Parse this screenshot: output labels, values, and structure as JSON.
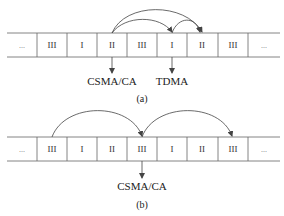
{
  "figure_a": {
    "caption": "(a)",
    "cells": [
      "...",
      "III",
      "I",
      "II",
      "III",
      "I",
      "II",
      "III",
      "..."
    ],
    "labels": {
      "csma": "CSMA/CA",
      "tdma": "TDMA"
    }
  },
  "figure_b": {
    "caption": "(b)",
    "cells": [
      "...",
      "III",
      "I",
      "II",
      "III",
      "I",
      "II",
      "III",
      "..."
    ],
    "labels": {
      "csma": "CSMA/CA"
    }
  },
  "colors": {
    "line": "#555555",
    "text": "#222222"
  }
}
